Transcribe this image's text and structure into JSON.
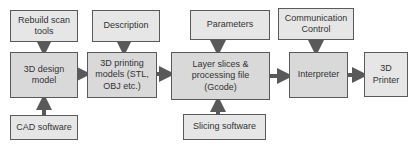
{
  "diagram": {
    "type": "flowchart",
    "colors": {
      "box_fill": "#e6e6e6",
      "main_fill": "#d9d9d9",
      "border": "#5a5a5a",
      "arrow": "#595959",
      "text": "#333333"
    },
    "nodes": {
      "rebuild_scan_tools": "Rebuild scan tools",
      "design_model": "3D design model",
      "cad_software": "CAD software",
      "description": "Description",
      "printing_models": "3D printing models (STL, OBJ etc.)",
      "parameters": "Parameters",
      "layer_slices": "Layer slices & processing file (Gcode)",
      "slicing_software": "Slicing software",
      "communication_control": "Communication Control",
      "interpreter": "Interpreter",
      "printer": "3D Printer"
    },
    "edges": [
      [
        "Rebuild scan tools",
        "3D design model"
      ],
      [
        "CAD software",
        "3D design model"
      ],
      [
        "3D design model",
        "3D printing models (STL, OBJ etc.)"
      ],
      [
        "Description",
        "3D printing models (STL, OBJ etc.)"
      ],
      [
        "3D printing models (STL, OBJ etc.)",
        "Layer slices & processing file (Gcode)"
      ],
      [
        "Parameters",
        "Layer slices & processing file (Gcode)"
      ],
      [
        "Slicing software",
        "Layer slices & processing file (Gcode)"
      ],
      [
        "Layer slices & processing file (Gcode)",
        "Interpreter"
      ],
      [
        "Communication Control",
        "Interpreter"
      ],
      [
        "Interpreter",
        "3D Printer"
      ]
    ]
  }
}
